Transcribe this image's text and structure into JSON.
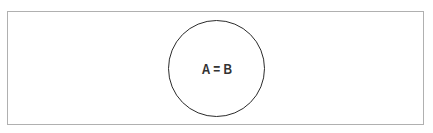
{
  "diagram": {
    "type": "venn",
    "circles": [
      {
        "label": "A = B",
        "stroke_color": "#2b2b2b"
      }
    ],
    "frame_border_color": "#b0b0b0"
  }
}
